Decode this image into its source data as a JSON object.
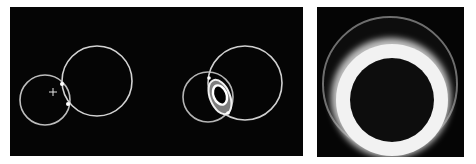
{
  "figure": {
    "background": "#ffffff",
    "panels": [
      {
        "name": "panel-circle-pairs",
        "box": {
          "x": 10,
          "y": 7,
          "w": 293,
          "h": 149
        },
        "fill": "#050505",
        "pairs": [
          {
            "name": "touching-pair",
            "small_circle": {
              "cx": 45,
              "cy": 100,
              "r": 25
            },
            "large_circle": {
              "cx": 97,
              "cy": 81,
              "r": 35
            },
            "contact_points": [
              {
                "x": 62,
                "y": 84
              },
              {
                "x": 68,
                "y": 104
              }
            ],
            "crosshair": {
              "x": 53,
              "y": 92,
              "size": 4
            }
          },
          {
            "name": "overlapping-pair",
            "small_circle": {
              "cx": 208,
              "cy": 97,
              "r": 25
            },
            "large_circle": {
              "cx": 245,
              "cy": 83,
              "r": 37
            },
            "lens": {
              "cx": 220,
              "cy": 97,
              "rx": 10,
              "ry": 17,
              "rotate": -20
            },
            "inner_ellipse": {
              "cx": 220,
              "cy": 94,
              "rx": 7,
              "ry": 10,
              "rotate": -20
            }
          }
        ]
      },
      {
        "name": "panel-ring",
        "box": {
          "x": 317,
          "y": 7,
          "w": 147,
          "h": 150
        },
        "fill": "#050505",
        "outer_faint_circle": {
          "cx": 390,
          "cy": 84,
          "r": 67
        },
        "bright_band": {
          "cx": 391,
          "cy": 72,
          "r": 52
        },
        "ring": {
          "cx": 392,
          "cy": 100,
          "r_outer": 56,
          "r_inner": 42
        }
      }
    ],
    "colors": {
      "ring_white": "#f4f4f4",
      "faint_gray": "#7a7a7a",
      "line_gray": "#cfcfcf"
    }
  }
}
